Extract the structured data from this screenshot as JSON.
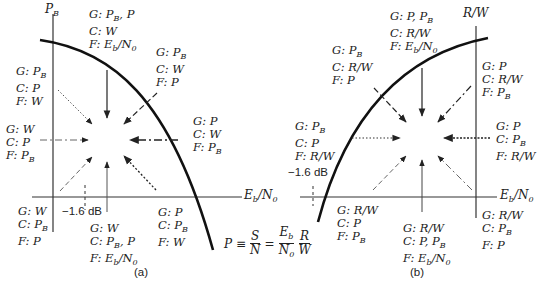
{
  "panel_a": {
    "caption": "(a)",
    "y_axis_label": "P_B",
    "x_axis_label": "E_b/N_0",
    "shannon_limit": "−1.6 dB",
    "labels": [
      {
        "id": "top",
        "g": "G: P_B, P",
        "c": "C: W",
        "f": "F: E_b/N_0"
      },
      {
        "id": "upper-right",
        "g": "G: P_B",
        "c": "C: W",
        "f": "F: P"
      },
      {
        "id": "right",
        "g": "G: P",
        "c": "C: W",
        "f": "F: P_B"
      },
      {
        "id": "lower-right",
        "g": "G: P",
        "c": "C: P_B",
        "f": "F: W"
      },
      {
        "id": "bottom",
        "g": "G: W",
        "c": "C: P_B, P",
        "f": "F: E_b/N_0"
      },
      {
        "id": "lower-left",
        "g": "G: W",
        "c": "C: P_B",
        "f": "F: P"
      },
      {
        "id": "left",
        "g": "G: W",
        "c": "C: P",
        "f": "F: P_B"
      },
      {
        "id": "upper-left",
        "g": "G: P_B",
        "c": "C: P",
        "f": "F: W"
      }
    ]
  },
  "panel_b": {
    "caption": "(b)",
    "y_axis_label": "R/W",
    "x_axis_label": "E_b/N_0",
    "shannon_limit": "−1.6 dB",
    "labels": [
      {
        "id": "top",
        "g": "G: P, P_B",
        "c": "C: R/W",
        "f": "F: E_b/N_0"
      },
      {
        "id": "upper-left",
        "g": "G: P_B",
        "c": "C: R/W",
        "f": "F: P"
      },
      {
        "id": "upper-right",
        "g": "G: P",
        "c": "C: R/W",
        "f": "F: P_B"
      },
      {
        "id": "left",
        "g": "G: P_B",
        "c": "C: P",
        "f": "F: R/W"
      },
      {
        "id": "right",
        "g": "G: P",
        "c": "C: P_B",
        "f": "F: R/W"
      },
      {
        "id": "lower-left",
        "g": "G: R/W",
        "c": "C: P",
        "f": "F: P_B"
      },
      {
        "id": "bottom",
        "g": "G: R/W",
        "c": "C: P, P_B",
        "f": "F: E_b/N_0"
      },
      {
        "id": "lower-right",
        "g": "G: R/W",
        "c": "C: P_B",
        "f": "F: P"
      }
    ]
  },
  "formula": {
    "lhs": "P ≡",
    "frac1_num": "S",
    "frac1_den": "N",
    "eq": "=",
    "frac2_num": "E_b",
    "frac2_den": "N_0",
    "frac3_num": "R",
    "frac3_den": "W"
  },
  "colors": {
    "ink": "#222222",
    "curve": "#111111",
    "background": "#ffffff"
  }
}
